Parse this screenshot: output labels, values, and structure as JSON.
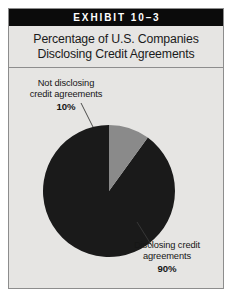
{
  "exhibit": {
    "header_label": "EXHIBIT 10–3",
    "subtitle_line_1": "Percentage of U.S. Companies",
    "subtitle_line_2": "Disclosing Credit Agreements"
  },
  "colors": {
    "page_background": "#ffffff",
    "panel_background": "#e6e5e3",
    "border": "#8d8d8d",
    "header_bar": "#0b0b0b",
    "header_text": "#ffffff",
    "body_text": "#161616",
    "slice_disclosing": "#1a1a1a",
    "slice_not_disclosing": "#8a8a8a",
    "leader_line": "#3a3a3a"
  },
  "callouts": {
    "not_disclosing": {
      "line_1": "Not disclosing",
      "line_2": "credit agreements",
      "percent": "10%"
    },
    "disclosing": {
      "line_1": "Disclosing credit",
      "line_2": "agreements",
      "percent": "90%"
    }
  },
  "chart_data": {
    "type": "pie",
    "title": "Percentage of U.S. Companies Disclosing Credit Agreements",
    "xlabel": "",
    "ylabel": "",
    "legend_position": "callout-labels",
    "grid": false,
    "start_angle_deg": 90,
    "direction": "counterclockwise",
    "categories": [
      "Disclosing credit agreements",
      "Not disclosing credit agreements"
    ],
    "values": [
      90,
      10
    ],
    "value_unit": "percent",
    "slices": [
      {
        "label": "Disclosing credit agreements",
        "value": 90,
        "display_value": "90%",
        "color": "#1a1a1a"
      },
      {
        "label": "Not disclosing credit agreements",
        "value": 10,
        "display_value": "10%",
        "color": "#8a8a8a"
      }
    ]
  }
}
